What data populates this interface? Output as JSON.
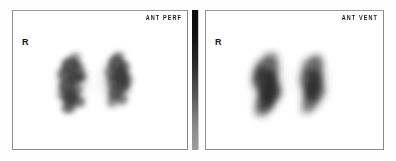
{
  "study": {
    "modality": "nuclear-medicine-vq-lung-scan",
    "background_color": "#fefefe",
    "frame_color": "#8a8a8a"
  },
  "panels": [
    {
      "id": "perfusion",
      "view_label": "ANT PERF",
      "side_marker": "R",
      "description": "Anterior perfusion image with patchy heterogeneous tracer uptake in both lung fields"
    },
    {
      "id": "ventilation",
      "view_label": "ANT VENT",
      "side_marker": "R",
      "description": "Anterior ventilation image with relatively homogeneous tracer distribution in both lung fields"
    }
  ],
  "colorbar": {
    "name": "grayscale-intensity-scale",
    "top_color": "#0a0a0a",
    "bottom_color": "#9c9c9c",
    "orientation": "vertical"
  }
}
